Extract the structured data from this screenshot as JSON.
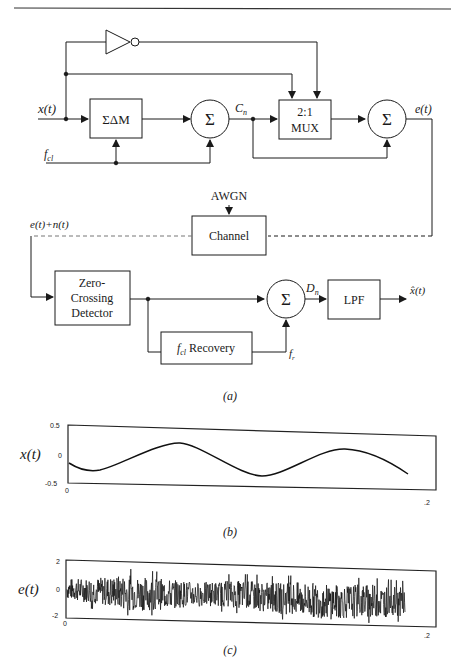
{
  "header": {
    "running_title_fragment": "...QUENCE"
  },
  "diagram": {
    "caption": "(a)",
    "inputs": {
      "x": "x(t)",
      "fcl": "f",
      "fcl_sub": "cl"
    },
    "blocks": {
      "sdm": "ΣΔM",
      "sum1": "Σ",
      "mux_line1": "2:1",
      "mux_line2": "MUX",
      "sum2": "Σ",
      "channel": "Channel",
      "zcd_line1": "Zero-",
      "zcd_line2": "Crossing",
      "zcd_line3": "Detector",
      "sum3": "Σ",
      "lpf": "LPF",
      "recovery_f": "f",
      "recovery_sub": "cl",
      "recovery_label": " Recovery"
    },
    "signals": {
      "cn": "C",
      "cn_sub": "n",
      "et": "e(t)",
      "awgn": "AWGN",
      "received": "e(t)+n(t)",
      "dn": "D",
      "dn_sub": "n",
      "fr": "f",
      "fr_sub": "r",
      "output": "x̂(t)"
    }
  },
  "chart_data": [
    {
      "type": "line",
      "caption": "(b)",
      "ylabel": "x(t)",
      "xlabel": "",
      "xlim": [
        0,
        0.2
      ],
      "ylim": [
        -0.5,
        0.5
      ],
      "x_tick_labels": [
        "0",
        ".2"
      ],
      "y_tick_labels": [
        "0.5",
        "0",
        "-0.5"
      ],
      "grid": false,
      "series": [
        {
          "name": "x(t)",
          "x": [
            0,
            0.01,
            0.02,
            0.03,
            0.04,
            0.05,
            0.06,
            0.07,
            0.08,
            0.09,
            0.1,
            0.11,
            0.12,
            0.13,
            0.14,
            0.15,
            0.16,
            0.17,
            0.18,
            0.185
          ],
          "values": [
            -0.15,
            -0.27,
            -0.28,
            -0.22,
            -0.1,
            0.05,
            0.18,
            0.22,
            0.15,
            0.0,
            -0.15,
            -0.3,
            -0.33,
            -0.25,
            -0.1,
            0.03,
            0.12,
            0.1,
            -0.05,
            -0.3
          ]
        }
      ]
    },
    {
      "type": "line",
      "caption": "(c)",
      "ylabel": "e(t)",
      "xlabel": "",
      "xlim": [
        0,
        0.2
      ],
      "ylim": [
        -2,
        2
      ],
      "x_tick_labels": [
        "0",
        ".2"
      ],
      "y_tick_labels": [
        "2",
        "0",
        "-2"
      ],
      "grid": false,
      "series": [
        {
          "name": "e(t)",
          "description": "dense noisy signal (Sigma-Delta modulated plus noise), band roughly -1.5 to +1 with occasional spikes to ±1.5, ending near x=0.185",
          "envelope_upper": [
            0.8,
            0.9,
            1.0,
            1.2,
            1.1,
            1.0,
            0.9,
            0.8,
            0.9,
            1.0,
            1.0,
            0.9,
            1.0,
            1.0,
            0.9,
            0.9,
            1.0,
            0.9,
            0.8
          ],
          "envelope_lower": [
            -0.8,
            -1.0,
            -1.2,
            -1.5,
            -1.5,
            -1.4,
            -1.2,
            -1.1,
            -1.0,
            -1.1,
            -1.3,
            -1.4,
            -1.6,
            -1.7,
            -1.8,
            -1.7,
            -1.6,
            -1.5,
            -1.4
          ]
        }
      ]
    }
  ]
}
